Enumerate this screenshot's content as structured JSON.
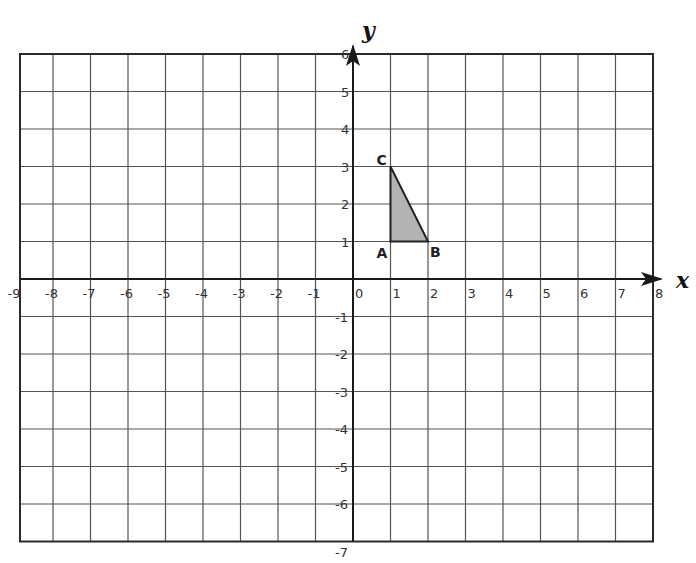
{
  "chart_data": {
    "type": "diagram",
    "title": "",
    "x_axis": {
      "label": "x",
      "min": -9,
      "max": 8,
      "ticks": [
        -9,
        -8,
        -7,
        -6,
        -5,
        -4,
        -3,
        -2,
        -1,
        0,
        1,
        2,
        3,
        4,
        5,
        6,
        7,
        8
      ]
    },
    "y_axis": {
      "label": "y",
      "min": -7,
      "max": 6,
      "ticks": [
        -7,
        -6,
        -5,
        -4,
        -3,
        -2,
        -1,
        1,
        2,
        3,
        4,
        5,
        6
      ]
    },
    "grid": true,
    "shapes": [
      {
        "type": "polygon",
        "name": "triangle ABC",
        "fill": "#b3b3b3",
        "vertices": [
          {
            "label": "A",
            "x": 1,
            "y": 1
          },
          {
            "label": "B",
            "x": 2,
            "y": 1
          },
          {
            "label": "C",
            "x": 1,
            "y": 3
          }
        ]
      }
    ]
  },
  "axes": {
    "x_label": "x",
    "y_label": "y"
  },
  "colors": {
    "grid": "#555555",
    "axis": "#1a1a1a",
    "triangle_fill": "#b3b3b3",
    "triangle_stroke": "#222222"
  }
}
